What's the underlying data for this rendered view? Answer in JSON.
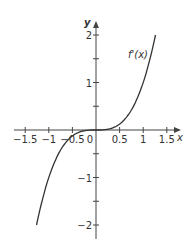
{
  "chart_data": {
    "type": "line",
    "title": "",
    "xlabel": "x",
    "ylabel": "y",
    "xlim": [
      -1.75,
      1.75
    ],
    "ylim": [
      -2.2,
      2.2
    ],
    "x_ticks": [
      "-1.5",
      "-1",
      "-0.5",
      "0",
      "0.5",
      "1",
      "1.5"
    ],
    "y_ticks": [
      "2",
      "1",
      "-1",
      "-2"
    ],
    "grid": false,
    "series": [
      {
        "name": "f'(x)",
        "function": "x^3",
        "x": [
          -1.26,
          -1,
          -0.75,
          -0.5,
          -0.25,
          0,
          0.25,
          0.5,
          0.75,
          1,
          1.26
        ],
        "y": [
          -2,
          -1,
          -0.42,
          -0.125,
          -0.016,
          0,
          0.016,
          0.125,
          0.42,
          1,
          2
        ]
      }
    ],
    "annotations": [
      {
        "text": "f'(x)",
        "x": 0.75,
        "y": 1.8
      }
    ]
  }
}
